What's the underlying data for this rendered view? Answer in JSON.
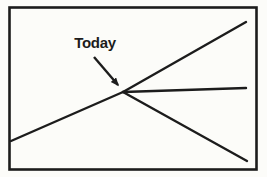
{
  "diagram": {
    "label": "Today",
    "colors": {
      "ink": "#1c1c1c",
      "paper": "#fcfcf9"
    },
    "frame": {
      "x": 9.5,
      "y": 7.5,
      "width": 247,
      "height": 162
    },
    "vertex": {
      "x": 123,
      "y": 92
    },
    "lines": [
      {
        "name": "past-trend-line",
        "x1": 11,
        "y1": 141,
        "x2": 123,
        "y2": 92
      },
      {
        "name": "upper-projection-line",
        "x1": 123,
        "y1": 92,
        "x2": 246,
        "y2": 22
      },
      {
        "name": "flat-projection-line",
        "x1": 123,
        "y1": 92,
        "x2": 246,
        "y2": 88
      },
      {
        "name": "lower-projection-line",
        "x1": 123,
        "y1": 92,
        "x2": 247,
        "y2": 161
      }
    ],
    "arrow": {
      "x1": 94,
      "y1": 57,
      "x2": 118,
      "y2": 85
    }
  }
}
